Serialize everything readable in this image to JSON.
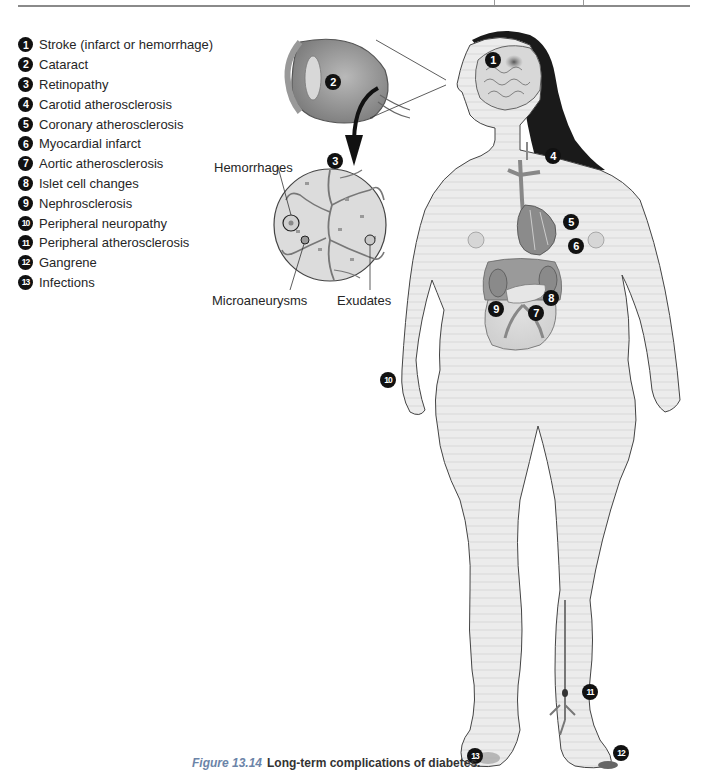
{
  "legend": [
    {
      "num": "1",
      "label": "Stroke (infarct or hemorrhage)"
    },
    {
      "num": "2",
      "label": "Cataract"
    },
    {
      "num": "3",
      "label": "Retinopathy"
    },
    {
      "num": "4",
      "label": "Carotid atherosclerosis"
    },
    {
      "num": "5",
      "label": "Coronary atherosclerosis"
    },
    {
      "num": "6",
      "label": "Myocardial infarct"
    },
    {
      "num": "7",
      "label": "Aortic atherosclerosis"
    },
    {
      "num": "8",
      "label": "Islet cell changes"
    },
    {
      "num": "9",
      "label": "Nephrosclerosis"
    },
    {
      "num": "10",
      "label": "Peripheral neuropathy"
    },
    {
      "num": "11",
      "label": "Peripheral atherosclerosis"
    },
    {
      "num": "12",
      "label": "Gangrene"
    },
    {
      "num": "13",
      "label": "Infections"
    }
  ],
  "retina_callouts": {
    "hemorrhages": "Hemorrhages",
    "microaneurysms": "Microaneurysms",
    "exudates": "Exudates"
  },
  "markers": {
    "stroke": "1",
    "cataract": "2",
    "retinopathy": "3",
    "carotid": "4",
    "coronary": "5",
    "myocardial": "6",
    "aortic": "7",
    "islet": "8",
    "nephro": "9",
    "neuropathy": "10",
    "peripheral": "11",
    "gangrene": "12",
    "infections": "13"
  },
  "caption": {
    "figure_label": "Figure 13.14",
    "text": "Long-term complications of diabetes."
  },
  "colors": {
    "marker": "#111111",
    "figure_label": "#6b84a8",
    "body_fill": "#ececec",
    "hair": "#1a1a1a",
    "vessel": "#8d8d8d"
  }
}
